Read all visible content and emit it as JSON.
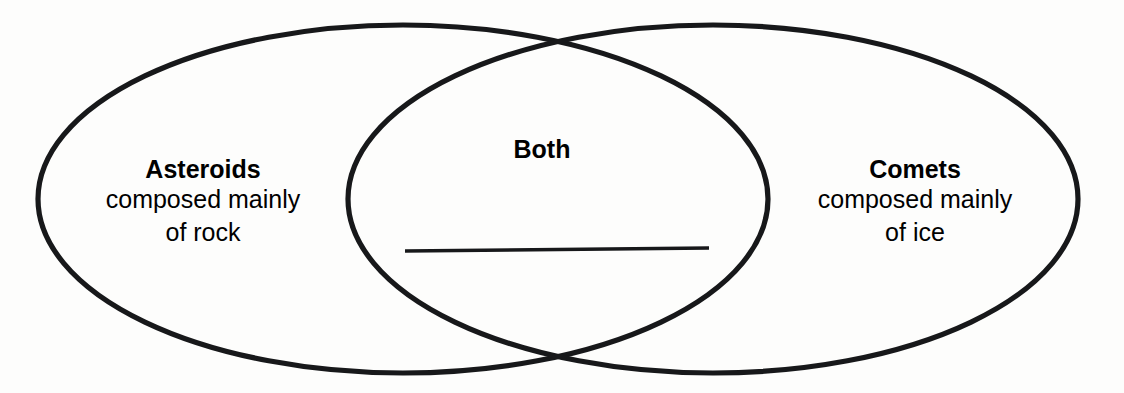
{
  "diagram": {
    "type": "venn-diagram",
    "title": "",
    "background_color": "#fdfdfc",
    "stroke_color": "#17181a",
    "text_color": "#17181a",
    "sets": [
      {
        "id": "asteroids",
        "region": "left-only",
        "heading": "Asteroids",
        "lines": [
          "composed mainly",
          "of rock"
        ]
      },
      {
        "id": "both",
        "region": "intersection",
        "heading": "Both",
        "lines": [],
        "answer_blank": true
      },
      {
        "id": "comets",
        "region": "right-only",
        "heading": "Comets",
        "lines": [
          "composed mainly",
          "of ice"
        ]
      }
    ]
  },
  "labels": {
    "asteroids_heading": "Asteroids",
    "asteroids_line1": "composed mainly",
    "asteroids_line2": "of rock",
    "both_heading": "Both",
    "comets_heading": "Comets",
    "comets_line1": "composed mainly",
    "comets_line2": "of ice"
  }
}
